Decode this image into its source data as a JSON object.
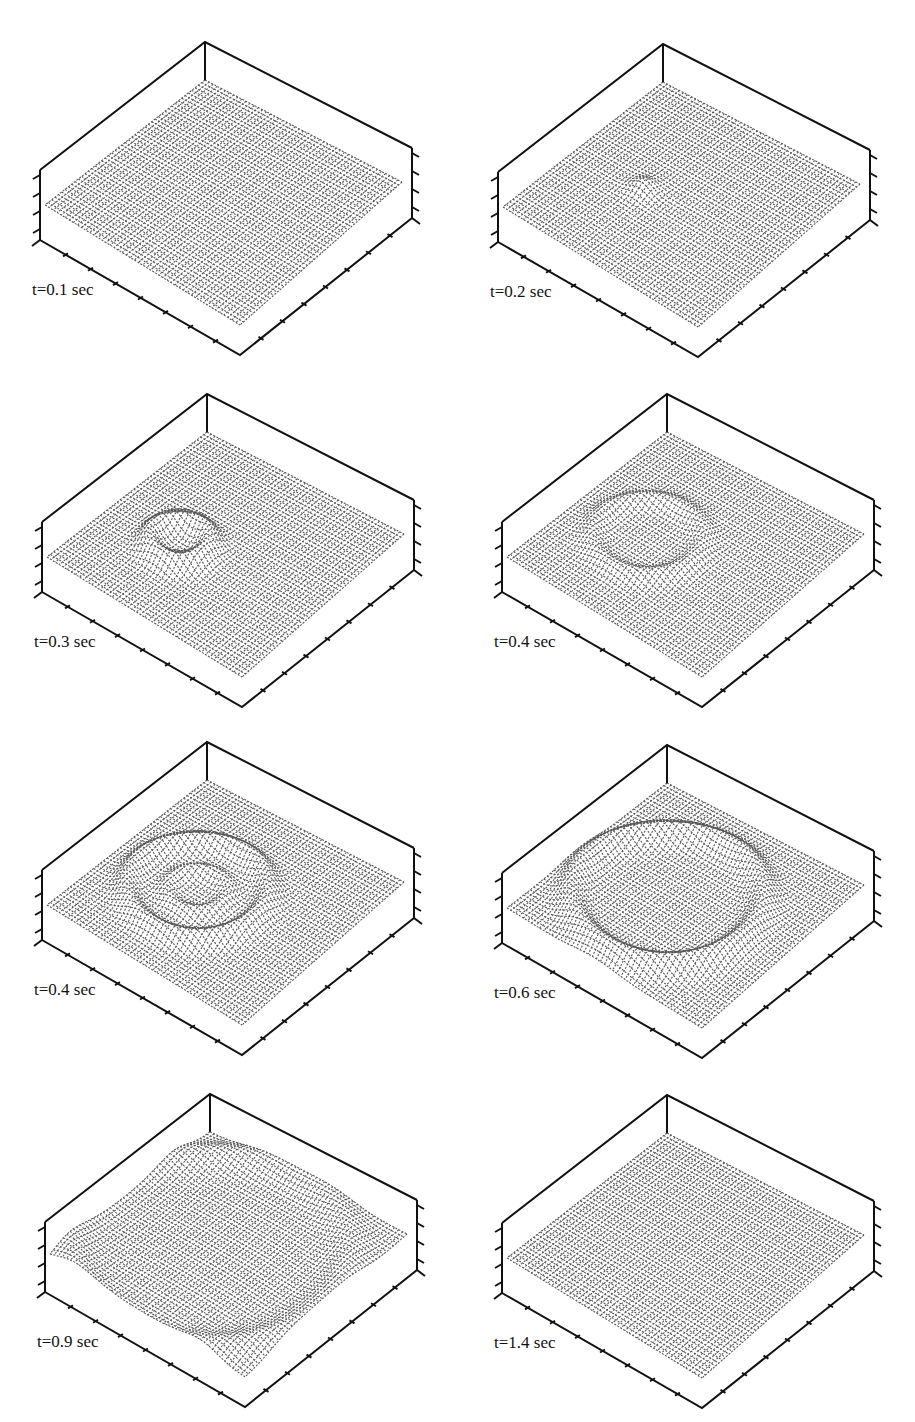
{
  "header_fragment": "",
  "figure": {
    "colors": {
      "ink": "#111111",
      "surface": "#3a3a3a",
      "background": "#ffffff"
    }
  },
  "panels": [
    {
      "label": "t=0.1 sec",
      "feature": "flat"
    },
    {
      "label": "t=0.2 sec",
      "feature": "small-bump"
    },
    {
      "label": "t=0.3 sec",
      "feature": "ring-bump"
    },
    {
      "label": "t=0.4 sec",
      "feature": "ring-spreading"
    },
    {
      "label": "t=0.4 sec",
      "feature": "ring-double"
    },
    {
      "label": "t=0.6 sec",
      "feature": "ring-large"
    },
    {
      "label": "t=0.9 sec",
      "feature": "ring-edge"
    },
    {
      "label": "t=1.4 sec",
      "feature": "flat"
    }
  ],
  "chart_data": [
    {
      "type": "surface",
      "title": "t=0.1 sec",
      "time_s": 0.1,
      "zlim": "undisplayed",
      "grid": false,
      "note": "flat surface, no visible disturbance"
    },
    {
      "type": "surface",
      "title": "t=0.2 sec",
      "time_s": 0.2,
      "note": "small localized bump near front-left center"
    },
    {
      "type": "surface",
      "title": "t=0.3 sec",
      "time_s": 0.3,
      "note": "circular wavefront bump emerging at front-left"
    },
    {
      "type": "surface",
      "title": "t=0.4 sec",
      "time_s": 0.4,
      "note": "wavefront ring spreading, faint ridges"
    },
    {
      "type": "surface",
      "title": "t=0.4 sec",
      "time_s": 0.4,
      "note": "pronounced ring-shaped ridges across the surface"
    },
    {
      "type": "surface",
      "title": "t=0.6 sec",
      "time_s": 0.6,
      "note": "large ring ridge reaching toward boundaries"
    },
    {
      "type": "surface",
      "title": "t=0.9 sec",
      "time_s": 0.9,
      "note": "ring ridge near back boundary, fading"
    },
    {
      "type": "surface",
      "title": "t=1.4 sec",
      "time_s": 1.4,
      "note": "flat surface, disturbance dissipated"
    }
  ]
}
